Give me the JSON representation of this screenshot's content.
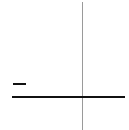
{
  "canvas": {
    "background": "#ffffff",
    "vertical_line_color": "#9a9a9a",
    "horizontal_line_color": "#111111",
    "dash_color": "#111111"
  },
  "elements": [
    {
      "type": "vertical-line",
      "label": ""
    },
    {
      "type": "horizontal-line",
      "label": ""
    },
    {
      "type": "minus-dash",
      "label": ""
    }
  ]
}
